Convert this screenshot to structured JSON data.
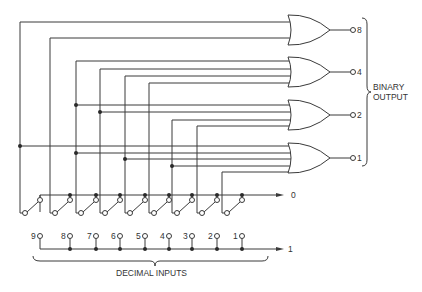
{
  "diagram": {
    "binary_output_label_line1": "BINARY",
    "binary_output_label_line2": "OUTPUT",
    "decimal_inputs_label": "DECIMAL INPUTS",
    "bus_zero_label": "0",
    "bus_one_label": "1",
    "decimal_inputs": [
      "9",
      "8",
      "7",
      "6",
      "5",
      "4",
      "3",
      "2",
      "1"
    ],
    "gates": [
      {
        "output_label": "8",
        "type": "OR",
        "inputs": [
          "9",
          "8"
        ]
      },
      {
        "output_label": "4",
        "type": "OR",
        "inputs": [
          "7",
          "6",
          "5",
          "4"
        ]
      },
      {
        "output_label": "2",
        "type": "OR",
        "inputs": [
          "7",
          "6",
          "3",
          "2"
        ]
      },
      {
        "output_label": "1",
        "type": "OR",
        "inputs": [
          "9",
          "7",
          "5",
          "3",
          "1"
        ]
      }
    ]
  }
}
